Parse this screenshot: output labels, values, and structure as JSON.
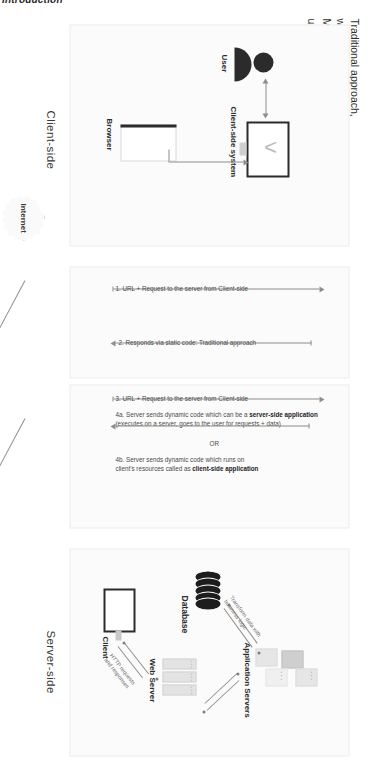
{
  "page": {
    "heading": "Introduction"
  },
  "sections": {
    "client_side_label": "Client-side",
    "server_side_label": "Server-side"
  },
  "callouts": {
    "traditional": {
      "line1": "Traditional approach,",
      "line2": "without using JavaScript"
    },
    "modern": {
      "line1": "Modern approach,",
      "line2": "using JavaScript"
    }
  },
  "internet": {
    "label": "Internet"
  },
  "client_side": {
    "user_label": "User",
    "system_label": "Client-side system",
    "browser_label": "Browser"
  },
  "server_side": {
    "database_label": "Database",
    "application_servers_label": "Application Servers",
    "web_server_label": "Web Server",
    "client_label": "Client",
    "arrow_db_label_line1": "Transform data with",
    "arrow_db_label_line2": "business logic",
    "arrow_http_label_line1": "HTTP requests",
    "arrow_http_label_line2": "and responses",
    "web_server_leds": "• • •",
    "app_server_dots": "• • •"
  },
  "flow": {
    "traditional": [
      {
        "id": "step1",
        "text": "1. URL + Request to the server from Client-side"
      },
      {
        "id": "step2",
        "text": "2. Responds via static code: Traditional approach"
      }
    ],
    "modern": [
      {
        "id": "step3",
        "text": "3. URL + Request to the server from Client-side"
      },
      {
        "id": "step4a",
        "text_plain": "4a. Server sends dynamic code which can be a ",
        "text_bold": "server-side application",
        "text_sub": "(executes on a server, goes to the user for requests + data)"
      },
      {
        "id": "or",
        "text": "OR"
      },
      {
        "id": "step4b",
        "text_plain": "4b. Server sends dynamic code which runs on",
        "text_sub_plain": "client's resources called as ",
        "text_sub_bold": "client-side application"
      }
    ]
  },
  "colors": {
    "ink": "#2b2b2b",
    "line": "#8d8d8d",
    "panel_bg": "#fbfbfb",
    "panel_border": "#ededed"
  }
}
